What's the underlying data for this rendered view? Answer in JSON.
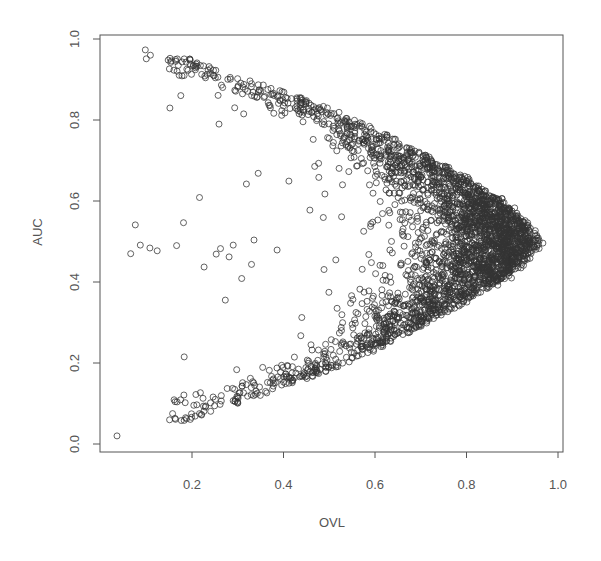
{
  "chart_data": {
    "type": "scatter",
    "title": "",
    "xlabel": "OVL",
    "ylabel": "AUC",
    "xlim": [
      0.0,
      1.02
    ],
    "ylim": [
      -0.02,
      1.02
    ],
    "grid": false,
    "legend": null,
    "marker": "open-circle",
    "marker_color": "#333333",
    "x_ticks": [
      {
        "value": 0.2,
        "label": "0.2"
      },
      {
        "value": 0.4,
        "label": "0.4"
      },
      {
        "value": 0.6,
        "label": "0.6"
      },
      {
        "value": 0.8,
        "label": "0.8"
      },
      {
        "value": 1.0,
        "label": "1.0"
      }
    ],
    "y_ticks": [
      {
        "value": 0.0,
        "label": "0.0"
      },
      {
        "value": 0.2,
        "label": "0.2"
      },
      {
        "value": 0.4,
        "label": "0.4"
      },
      {
        "value": 0.6,
        "label": "0.6"
      },
      {
        "value": 0.8,
        "label": "0.8"
      },
      {
        "value": 1.0,
        "label": "1.0"
      }
    ],
    "shape_description": "Sideways-V / arrowhead cloud: points bounded above by a curve from (0.10,0.97) to (0.97,0.50) and below by its mirror from (0.10,0.04) to (0.97,0.50); dense band hugging both boundaries, sparser interior, tip at OVL≈0.97, AUC≈0.50",
    "approx_point_count": 3000,
    "boundary": {
      "x": [
        0.1,
        0.2,
        0.3,
        0.4,
        0.5,
        0.6,
        0.7,
        0.8,
        0.9,
        0.97
      ],
      "upper_auc": [
        0.97,
        0.95,
        0.91,
        0.87,
        0.83,
        0.78,
        0.72,
        0.66,
        0.58,
        0.5
      ],
      "lower_auc": [
        0.04,
        0.06,
        0.1,
        0.14,
        0.18,
        0.23,
        0.29,
        0.35,
        0.42,
        0.5
      ]
    },
    "notable_points": [
      {
        "x": 0.036,
        "y": 0.02
      },
      {
        "x": 0.066,
        "y": 0.47
      },
      {
        "x": 0.076,
        "y": 0.541
      },
      {
        "x": 0.087,
        "y": 0.491
      },
      {
        "x": 0.108,
        "y": 0.484
      },
      {
        "x": 0.124,
        "y": 0.477
      },
      {
        "x": 0.183,
        "y": 0.215
      },
      {
        "x": 0.253,
        "y": 0.469
      },
      {
        "x": 0.281,
        "y": 0.462
      },
      {
        "x": 0.29,
        "y": 0.491
      },
      {
        "x": 0.386,
        "y": 0.479
      },
      {
        "x": 0.098,
        "y": 0.973
      },
      {
        "x": 0.109,
        "y": 0.96
      },
      {
        "x": 0.1,
        "y": 0.951
      },
      {
        "x": 0.148,
        "y": 0.948
      },
      {
        "x": 0.187,
        "y": 0.943
      },
      {
        "x": 0.196,
        "y": 0.948
      },
      {
        "x": 0.211,
        "y": 0.941
      },
      {
        "x": 0.259,
        "y": 0.79
      },
      {
        "x": 0.967,
        "y": 0.496
      }
    ]
  },
  "axes": {
    "x_title": "OVL",
    "y_title": "AUC"
  }
}
